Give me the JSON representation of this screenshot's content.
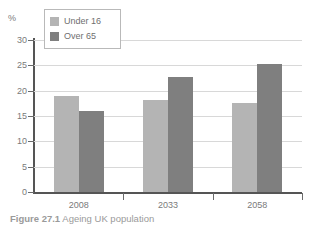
{
  "figure": {
    "caption_number": "Figure 27.1",
    "caption_text": "Ageing UK population"
  },
  "legend": {
    "position": "top-left-inside",
    "entries": [
      {
        "label": "Under 16",
        "color": "#b4b4b4"
      },
      {
        "label": "Over 65",
        "color": "#7f7f7f"
      }
    ]
  },
  "axis": {
    "y_unit_label": "%",
    "y_ticks": [
      "30",
      "25",
      "20",
      "15",
      "10",
      "5",
      "0"
    ],
    "x_ticks": [
      "2008",
      "2033",
      "2058"
    ]
  },
  "chart_data": {
    "type": "bar",
    "title": "",
    "subtitle": "",
    "xlabel": "",
    "ylabel": "%",
    "ylim": [
      0,
      30
    ],
    "ytick_values": [
      0,
      5,
      10,
      15,
      20,
      25,
      30
    ],
    "grid": true,
    "legend_position": "top-left",
    "categories": [
      "2008",
      "2033",
      "2058"
    ],
    "series": [
      {
        "name": "Under 16",
        "color": "#b4b4b4",
        "values": [
          19.0,
          18.2,
          17.5
        ]
      },
      {
        "name": "Over 65",
        "color": "#7f7f7f",
        "values": [
          16.0,
          22.7,
          25.2
        ]
      }
    ],
    "annotations": []
  }
}
